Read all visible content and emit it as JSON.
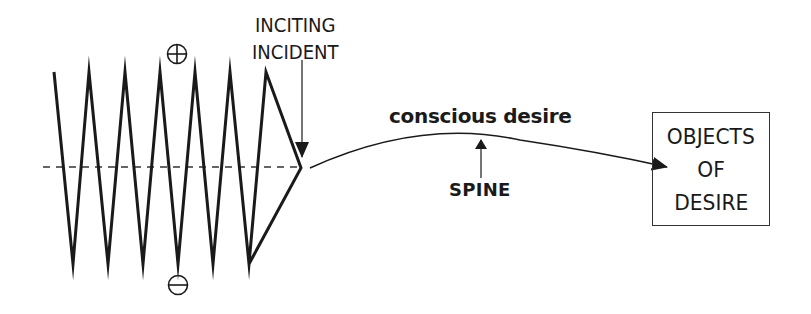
{
  "diagram": {
    "labels": {
      "inciting_line1": "INCITING",
      "inciting_line2": "INCIDENT",
      "conscious_desire": "conscious desire",
      "spine": "SPINE",
      "objects_line1": "OBJECTS",
      "objects_line2": "OF",
      "objects_line3": "DESIRE"
    },
    "symbols": {
      "positive": "plus-in-circle",
      "negative": "minus-in-circle"
    },
    "zigzag": {
      "description": "Oscillating line between positive and negative charge, converging to a point at the inciting incident",
      "points": [
        [
          54,
          72
        ],
        [
          73,
          264
        ],
        [
          89,
          72
        ],
        [
          108,
          264
        ],
        [
          125,
          72
        ],
        [
          143,
          264
        ],
        [
          160,
          72
        ],
        [
          178,
          264
        ],
        [
          195,
          72
        ],
        [
          213,
          264
        ],
        [
          230,
          72
        ],
        [
          249,
          264
        ],
        [
          266,
          72
        ],
        [
          301,
          168
        ],
        [
          249,
          264
        ]
      ],
      "peak_count": 7,
      "trough_count": 6
    },
    "baseline": {
      "style": "dashed",
      "y": 167,
      "x_start": 43,
      "x_end": 301
    },
    "colors": {
      "stroke": "#1a1a1a",
      "background": "#ffffff"
    }
  }
}
